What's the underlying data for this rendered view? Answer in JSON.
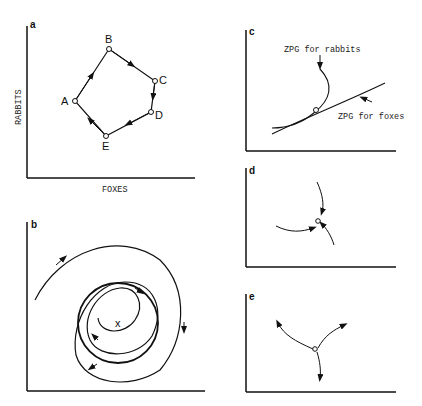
{
  "panels": {
    "a": {
      "label": "a",
      "ylabel": "RABBITS",
      "xlabel": "FOXES",
      "points": [
        "A",
        "B",
        "C",
        "D",
        "E"
      ]
    },
    "b": {
      "label": "b",
      "center": "x"
    },
    "c": {
      "label": "c",
      "rabbit_zpg": "ZPG for rabbits",
      "fox_zpg": "ZPG for foxes"
    },
    "d": {
      "label": "d"
    },
    "e": {
      "label": "e"
    }
  }
}
